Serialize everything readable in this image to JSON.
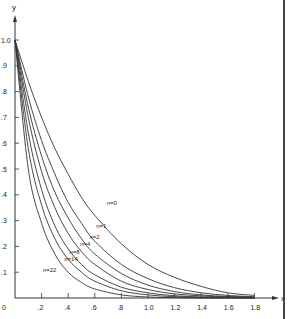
{
  "chart_data": {
    "type": "line",
    "title": "",
    "xlabel": "x",
    "ylabel": "y",
    "xlim": [
      0,
      1.8
    ],
    "ylim": [
      0,
      1.0
    ],
    "grid": false,
    "legend": "inline curve labels",
    "x_ticks": [
      "0",
      ".2",
      ".4",
      ".6",
      ".8",
      "1.0",
      "1.2",
      "1.4",
      "1.6",
      "1.8"
    ],
    "y_ticks": [
      ".1",
      ".2",
      ".3",
      ".4",
      ".5",
      ".6",
      ".7",
      ".8",
      ".9",
      "1.0"
    ],
    "origin_label": "0",
    "x": [
      0,
      0.1,
      0.2,
      0.3,
      0.4,
      0.5,
      0.6,
      0.8,
      1.0,
      1.2,
      1.4,
      1.6,
      1.8
    ],
    "series": [
      {
        "name": "n=0",
        "values": [
          1.0,
          0.84,
          0.7,
          0.58,
          0.48,
          0.39,
          0.32,
          0.21,
          0.13,
          0.08,
          0.045,
          0.02,
          0.01
        ]
      },
      {
        "name": "n=1",
        "values": [
          1.0,
          0.78,
          0.61,
          0.48,
          0.37,
          0.29,
          0.22,
          0.13,
          0.075,
          0.04,
          0.02,
          0.01,
          0.005
        ]
      },
      {
        "name": "n=2",
        "values": [
          1.0,
          0.74,
          0.55,
          0.41,
          0.31,
          0.23,
          0.17,
          0.095,
          0.05,
          0.025,
          0.012,
          0.006,
          0.003
        ]
      },
      {
        "name": "n=4",
        "values": [
          1.0,
          0.7,
          0.49,
          0.35,
          0.25,
          0.18,
          0.13,
          0.065,
          0.033,
          0.016,
          0.008,
          0.004,
          0.002
        ]
      },
      {
        "name": "n=8",
        "values": [
          1.0,
          0.64,
          0.42,
          0.28,
          0.19,
          0.13,
          0.09,
          0.042,
          0.02,
          0.009,
          0.004,
          0.002,
          0.001
        ]
      },
      {
        "name": "n=14",
        "values": [
          1.0,
          0.58,
          0.36,
          0.23,
          0.15,
          0.1,
          0.065,
          0.028,
          0.012,
          0.005,
          0.002,
          0.001,
          0.0
        ]
      },
      {
        "name": "n=22",
        "values": [
          1.0,
          0.5,
          0.29,
          0.17,
          0.1,
          0.06,
          0.035,
          0.012,
          0.004,
          0.001,
          0.0,
          0.0,
          0.0
        ]
      }
    ],
    "annotations": [
      {
        "text": "n=0",
        "x": 0.69,
        "y": 0.36
      },
      {
        "text": "n=1",
        "x": 0.61,
        "y": 0.27
      },
      {
        "text": "n=2",
        "x": 0.56,
        "y": 0.23
      },
      {
        "text": "n=4",
        "x": 0.49,
        "y": 0.2
      },
      {
        "text": "n=8",
        "x": 0.41,
        "y": 0.17
      },
      {
        "text": "n=14",
        "x": 0.37,
        "y": 0.145
      },
      {
        "text": "n=22",
        "x": 0.21,
        "y": 0.1
      }
    ]
  }
}
